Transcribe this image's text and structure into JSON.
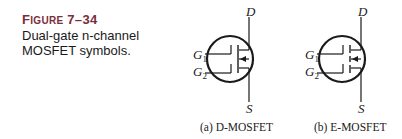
{
  "figure": {
    "label_prefix": "F",
    "label_smallcaps": "IGURE",
    "number": "7–34",
    "caption": "Dual-gate n-channel MOSFET symbols."
  },
  "symbols": [
    {
      "type": "D-MOSFET",
      "caption": "(a) D-MOSFET",
      "terminals": {
        "drain": "D",
        "source": "S",
        "gate1": "G",
        "gate1_sub": "1",
        "gate2": "G",
        "gate2_sub": "2"
      },
      "channel": "continuous"
    },
    {
      "type": "E-MOSFET",
      "caption": "(b) E-MOSFET",
      "terminals": {
        "drain": "D",
        "source": "S",
        "gate1": "G",
        "gate1_sub": "1",
        "gate2": "G",
        "gate2_sub": "2"
      },
      "channel": "broken"
    }
  ]
}
